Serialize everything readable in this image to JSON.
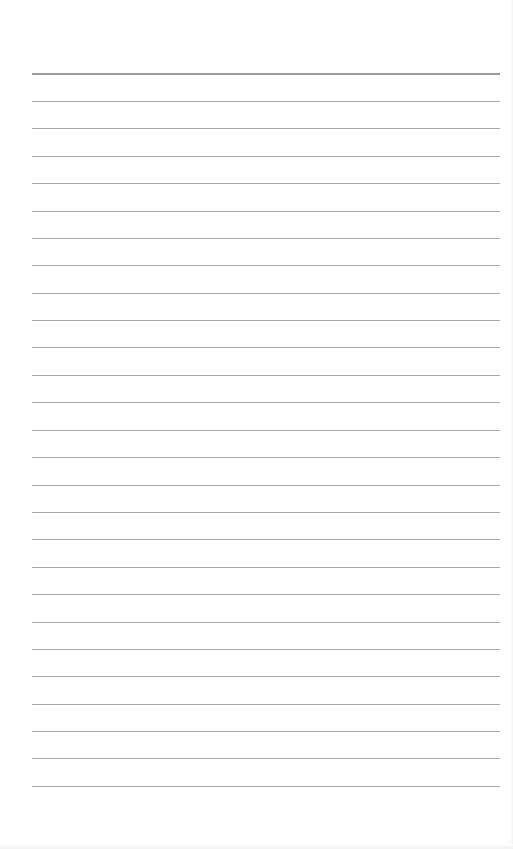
{
  "page": {
    "type": "lined-paper",
    "background_color": "#ffffff",
    "rule_color": "#a9a9a9",
    "top_rule_color": "#9a9a9a",
    "rule_count": 27,
    "rule_left_px": 32,
    "rule_right_px": 500,
    "first_rule_y_px": 73,
    "last_rule_y_px": 786,
    "rules_y_px": [
      73,
      101,
      128,
      156,
      183,
      211,
      238,
      265,
      293,
      320,
      347,
      375,
      402,
      430,
      457,
      485,
      512,
      539,
      567,
      594,
      622,
      649,
      676,
      704,
      731,
      758,
      786
    ]
  }
}
